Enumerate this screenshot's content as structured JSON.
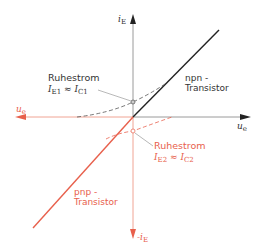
{
  "colors": {
    "black": "#222222",
    "gray_axis": "#9a9a9a",
    "red": "#e8604c",
    "red_light": "#f0a494",
    "background": "#ffffff"
  },
  "axes": {
    "y_pos_label": "i",
    "y_pos_sub": "E",
    "y_neg_label": "-i",
    "y_neg_sub": "E",
    "x_pos_label": "u",
    "x_pos_sub": "e",
    "x_neg_label": "u",
    "x_neg_sub": "e"
  },
  "npn": {
    "title_line1": "npn -",
    "title_line2": "Transistor",
    "quiescent_title": "Ruhestrom",
    "formula_lhs": "I",
    "formula_lhs_sub": "E1",
    "formula_eq": "≈",
    "formula_rhs": "I",
    "formula_rhs_sub": "C1"
  },
  "pnp": {
    "title_line1": "pnp -",
    "title_line2": "Transistor",
    "quiescent_title": "Ruhestrom",
    "formula_lhs": "I",
    "formula_lhs_sub": "E2",
    "formula_eq": "≈",
    "formula_rhs": "I",
    "formula_rhs_sub": "C2"
  }
}
